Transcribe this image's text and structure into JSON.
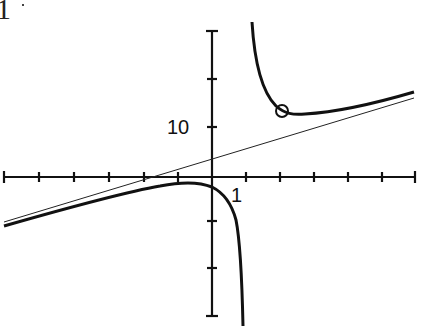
{
  "figure": {
    "corner_text": "1",
    "y_tick_label": "10",
    "x_tick_label": "1"
  },
  "axes": {
    "x_unit_px": 34,
    "y_unit_px": 5,
    "origin_px": [
      212,
      177
    ],
    "x_ticks": [
      -6,
      -5,
      -4,
      -3,
      -2,
      -1,
      1,
      2,
      3,
      4,
      5,
      6
    ],
    "y_ticks": [
      -25,
      -20,
      -15,
      10,
      20,
      30
    ],
    "labeled_x_tick": 1,
    "labeled_y_tick": 10
  },
  "curves": {
    "function_branches": [
      "upper-right branch",
      "lower-left branch"
    ],
    "slant_asymptote": "thin straight line",
    "marked_point": "open circle on upper branch near x = 2"
  },
  "colors": {
    "ink": "#111111",
    "background": "#ffffff"
  }
}
